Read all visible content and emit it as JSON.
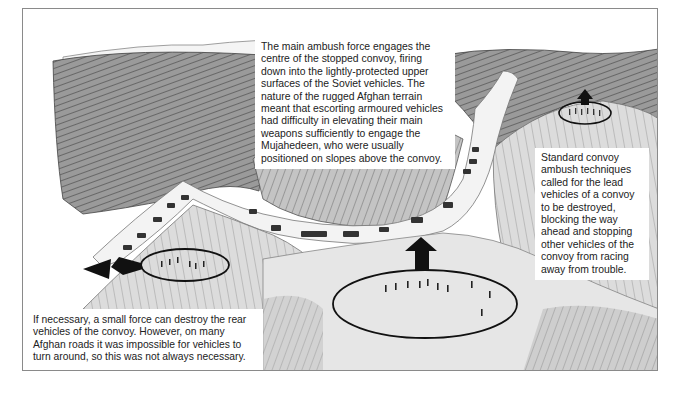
{
  "figure": {
    "type": "illustration",
    "colors": {
      "ink": "#222222",
      "frame": "#8a8a8a",
      "terrain_dark": "#6e6e6e",
      "terrain_mid": "#a8a8a8",
      "terrain_light": "#d6d6d6",
      "road": "#f2f2f2"
    }
  },
  "captions": {
    "main_ambush": "The main ambush force engages the centre of the stopped convoy, firing down into the lightly-protected upper surfaces of the Soviet vehicles. The nature of the rugged Afghan terrain meant that escorting armoured vehicles had difficulty in elevating their main weapons sufficiently to engage the Mujahedeen, who were usually positioned on slopes above the convoy.",
    "lead_vehicles": "Standard convoy ambush techniques called for the lead vehicles of a convoy to be destroyed, blocking the way ahead and stopping other vehicles of the convoy from racing away from trouble.",
    "rear_vehicles": "If necessary, a small force can destroy the rear vehicles of the convoy. However, on many Afghan roads it was impossible for vehicles to turn around, so this was not always necessary."
  },
  "markers": [
    {
      "name": "lead-blocking-force",
      "shape": "oval",
      "arrow": "up"
    },
    {
      "name": "main-ambush-force",
      "shape": "oval",
      "arrow": "up"
    },
    {
      "name": "rear-blocking-force",
      "shape": "oval",
      "arrow": "left"
    }
  ]
}
